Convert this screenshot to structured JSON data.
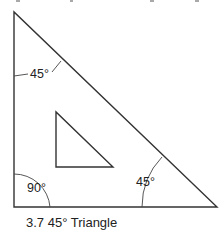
{
  "figure": {
    "caption": "3.7 45° Triangle",
    "stroke_color": "#333333",
    "outer_triangle": {
      "top": [
        14,
        12
      ],
      "bottom_left": [
        14,
        207
      ],
      "bottom_right": [
        217,
        207
      ]
    },
    "inner_triangle": {
      "top": [
        56,
        112
      ],
      "bottom_left": [
        56,
        167
      ],
      "bottom_right": [
        113,
        167
      ]
    },
    "angle_labels": [
      {
        "id": "top",
        "text": "45°",
        "x": 30,
        "y": 78
      },
      {
        "id": "bottom-left",
        "text": "90°",
        "x": 27,
        "y": 192
      },
      {
        "id": "bottom-right",
        "text": "45°",
        "x": 136,
        "y": 186
      }
    ]
  }
}
